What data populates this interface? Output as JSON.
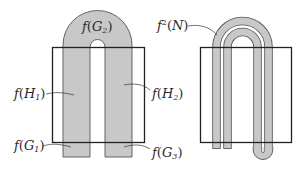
{
  "colors": {
    "fill": "#c8c8c8",
    "stroke": "#3a3a3a",
    "square": "#222222",
    "background": "#ffffff"
  },
  "left_diagram": {
    "labels": {
      "g2": {
        "f": "f",
        "open": "(",
        "var": "G",
        "sub": "2",
        "close": ")"
      },
      "h1": {
        "f": "f",
        "open": "(",
        "var": "H",
        "sub": "1",
        "close": ")"
      },
      "h2": {
        "f": "f",
        "open": "(",
        "var": "H",
        "sub": "2",
        "close": ")"
      },
      "g1": {
        "f": "f",
        "open": "(",
        "var": "G",
        "sub": "1",
        "close": ")"
      },
      "g3": {
        "f": "f",
        "open": "(",
        "var": "G",
        "sub": "3",
        "close": ")"
      }
    }
  },
  "right_diagram": {
    "labels": {
      "f2n": {
        "f": "f",
        "sup": "2",
        "open": "(",
        "var": "N",
        "close": ")"
      }
    }
  }
}
